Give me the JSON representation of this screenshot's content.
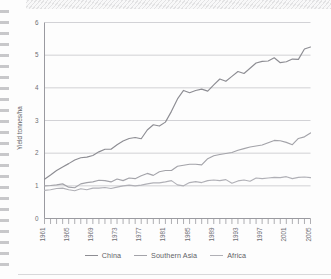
{
  "chart_data": {
    "type": "line",
    "title": "",
    "xlabel": "",
    "ylabel": "Yield tonnes/ha",
    "xlim": [
      1961,
      2005
    ],
    "ylim": [
      0,
      6
    ],
    "yticks": [
      0,
      1,
      2,
      3,
      4,
      5,
      6
    ],
    "ytick_labels": [
      "0",
      "1",
      "2",
      "3",
      "4",
      "5",
      "6"
    ],
    "xticks": [
      1961,
      1965,
      1969,
      1973,
      1977,
      1981,
      1985,
      1989,
      1993,
      1997,
      2001,
      2005
    ],
    "xtick_labels": [
      "1961",
      "1965",
      "1969",
      "1973",
      "1977",
      "1981",
      "1985",
      "1989",
      "1993",
      "1997",
      "2001",
      "2005"
    ],
    "xtick_minor_interval": 1,
    "grid": "horizontal",
    "legend_position": "bottom-center",
    "x": [
      1961,
      1962,
      1963,
      1964,
      1965,
      1966,
      1967,
      1968,
      1969,
      1970,
      1971,
      1972,
      1973,
      1974,
      1975,
      1976,
      1977,
      1978,
      1979,
      1980,
      1981,
      1982,
      1983,
      1984,
      1985,
      1986,
      1987,
      1988,
      1989,
      1990,
      1991,
      1992,
      1993,
      1994,
      1995,
      1996,
      1997,
      1998,
      1999,
      2000,
      2001,
      2002,
      2003,
      2004,
      2005
    ],
    "series": [
      {
        "name": "China",
        "color": "#8d8d93",
        "values": [
          1.2,
          1.33,
          1.47,
          1.58,
          1.68,
          1.79,
          1.86,
          1.88,
          1.93,
          2.04,
          2.12,
          2.12,
          2.26,
          2.37,
          2.45,
          2.48,
          2.44,
          2.71,
          2.87,
          2.83,
          2.95,
          3.28,
          3.66,
          3.92,
          3.85,
          3.92,
          3.96,
          3.9,
          4.09,
          4.27,
          4.2,
          4.35,
          4.5,
          4.44,
          4.6,
          4.76,
          4.81,
          4.82,
          4.92,
          4.77,
          4.8,
          4.88,
          4.87,
          5.19,
          5.25
        ]
      },
      {
        "name": "Southern Asia",
        "color": "#a3a3a9",
        "values": [
          1.0,
          1.01,
          1.03,
          1.06,
          0.96,
          0.94,
          1.06,
          1.1,
          1.12,
          1.17,
          1.16,
          1.12,
          1.21,
          1.16,
          1.24,
          1.22,
          1.31,
          1.38,
          1.32,
          1.43,
          1.47,
          1.47,
          1.6,
          1.63,
          1.66,
          1.66,
          1.64,
          1.83,
          1.92,
          1.96,
          1.99,
          2.02,
          2.09,
          2.14,
          2.19,
          2.22,
          2.25,
          2.32,
          2.39,
          2.38,
          2.33,
          2.26,
          2.45,
          2.5,
          2.62
        ]
      },
      {
        "name": "Africa",
        "color": "#b0b0b6",
        "values": [
          0.86,
          0.88,
          0.92,
          0.93,
          0.88,
          0.85,
          0.91,
          0.88,
          0.93,
          0.93,
          0.95,
          0.92,
          0.96,
          1.0,
          1.02,
          1.0,
          1.02,
          1.06,
          1.09,
          1.09,
          1.12,
          1.16,
          1.03,
          1.0,
          1.1,
          1.13,
          1.1,
          1.16,
          1.18,
          1.16,
          1.19,
          1.08,
          1.15,
          1.18,
          1.14,
          1.24,
          1.22,
          1.24,
          1.26,
          1.25,
          1.28,
          1.22,
          1.26,
          1.27,
          1.25
        ]
      }
    ]
  },
  "legend": {
    "items": [
      {
        "label": "China"
      },
      {
        "label": "Southern Asia"
      },
      {
        "label": "Africa"
      }
    ]
  }
}
